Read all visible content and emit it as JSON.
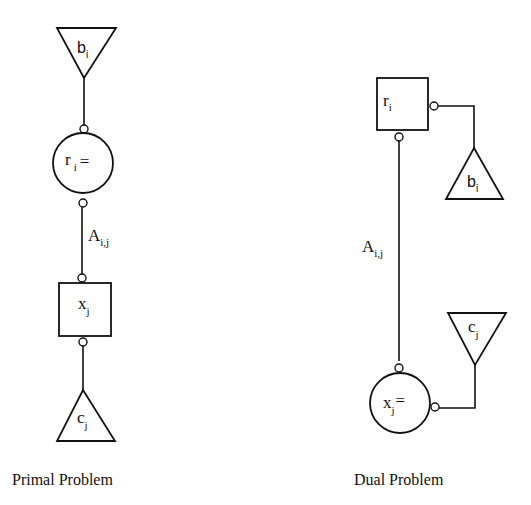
{
  "primal": {
    "caption": "Primal Problem",
    "top_triangle": {
      "label": "b",
      "sub": "i"
    },
    "constraint_node": {
      "label": "r",
      "sub": "i",
      "suffix": "="
    },
    "edge_label": {
      "label": "A",
      "sub": "i,j"
    },
    "variable_node": {
      "label": "x",
      "sub": "j"
    },
    "bottom_triangle": {
      "label": "c",
      "sub": "j"
    }
  },
  "dual": {
    "caption": "Dual Problem",
    "variable_box": {
      "label": "r",
      "sub": "i"
    },
    "right_triangle_top": {
      "label": "b",
      "sub": "i"
    },
    "edge_label": {
      "label": "A",
      "sub": "i,j"
    },
    "right_triangle_bottom": {
      "label": "c",
      "sub": "j"
    },
    "constraint_node": {
      "label": "x",
      "sub": "j",
      "suffix": "="
    }
  },
  "colors": {
    "stroke": "#111111",
    "background": "#ffffff"
  }
}
